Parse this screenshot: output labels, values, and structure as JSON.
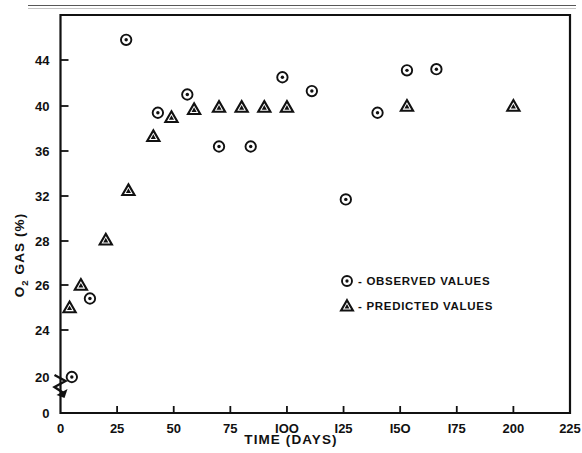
{
  "chart_data": {
    "type": "scatter",
    "title": "",
    "xlabel": "TIME  (DAYS)",
    "ylabel": "O2 GAS (%)",
    "ylabel_main": "O",
    "ylabel_sub": "2",
    "ylabel_rest": " GAS (%)",
    "xlim": [
      0,
      225
    ],
    "ylim": [
      0,
      46.5
    ],
    "grid": false,
    "legend_position": "center-right-inside",
    "xticks": [
      0,
      25,
      50,
      75,
      100,
      125,
      150,
      175,
      200,
      225
    ],
    "xticklabels": [
      "0",
      "25",
      "50",
      "75",
      "IOO",
      "I25",
      "I5O",
      "I75",
      "200",
      "225"
    ],
    "yticks": [
      0,
      20,
      24,
      26,
      28,
      32,
      36,
      40,
      44
    ],
    "yticklabels": [
      "0",
      "20",
      "24",
      "26",
      "28",
      "32",
      "36",
      "40",
      "44"
    ],
    "axis_break": {
      "present": true,
      "between": [
        0,
        20
      ],
      "style": "zigzag"
    },
    "series": [
      {
        "name": "OBSERVED VALUES",
        "marker": "circle-dot",
        "legend_label": "- OBSERVED VALUES",
        "points": [
          {
            "x": 5,
            "y": 20.0
          },
          {
            "x": 13,
            "y": 25.4
          },
          {
            "x": 29,
            "y": 45.8
          },
          {
            "x": 43,
            "y": 39.4
          },
          {
            "x": 56,
            "y": 41.0
          },
          {
            "x": 70,
            "y": 36.4
          },
          {
            "x": 84,
            "y": 36.4
          },
          {
            "x": 98,
            "y": 42.5
          },
          {
            "x": 111,
            "y": 41.3
          },
          {
            "x": 126,
            "y": 31.7
          },
          {
            "x": 140,
            "y": 39.4
          },
          {
            "x": 153,
            "y": 43.1
          },
          {
            "x": 166,
            "y": 43.2
          }
        ]
      },
      {
        "name": "PREDICTED VALUES",
        "marker": "triangle",
        "legend_label": "- PREDICTED VALUES",
        "points": [
          {
            "x": 4,
            "y": 25.0
          },
          {
            "x": 9,
            "y": 26.0
          },
          {
            "x": 20,
            "y": 28.1
          },
          {
            "x": 30,
            "y": 32.5
          },
          {
            "x": 41,
            "y": 37.3
          },
          {
            "x": 49,
            "y": 39.0
          },
          {
            "x": 59,
            "y": 39.7
          },
          {
            "x": 70,
            "y": 39.9
          },
          {
            "x": 80,
            "y": 39.9
          },
          {
            "x": 90,
            "y": 39.9
          },
          {
            "x": 100,
            "y": 39.9
          },
          {
            "x": 153,
            "y": 40.0
          },
          {
            "x": 200,
            "y": 40.0
          }
        ]
      }
    ]
  },
  "legend": {
    "observed": "- OBSERVED VALUES",
    "predicted": "- PREDICTED VALUES"
  },
  "axes": {
    "x_title": "TIME  (DAYS)",
    "y_title_main": "O",
    "y_title_sub": "2",
    "y_title_rest": "GAS (%)"
  },
  "colors": {
    "ink": "#111111",
    "paper": "#ffffff"
  }
}
